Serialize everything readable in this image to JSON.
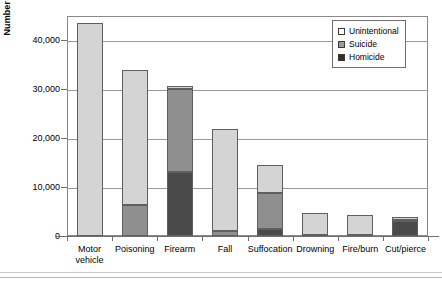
{
  "chart_data": {
    "type": "bar",
    "subtype": "stacked-bar",
    "title": "",
    "xlabel": "",
    "ylabel": "Number of Deaths",
    "ylim": [
      0,
      45000
    ],
    "yticks": [
      0,
      10000,
      20000,
      30000,
      40000
    ],
    "ytick_labels": [
      "0",
      "10,000",
      "20,000",
      "30,000",
      "40,000"
    ],
    "grid": true,
    "grid_axis": "y",
    "legend_position": "top-right",
    "categories": [
      "Motor\nvehicle",
      "Poisoning",
      "Firearm",
      "Fall",
      "Suffocation",
      "Drowning",
      "Fire/burn",
      "Cut/pierce"
    ],
    "series": [
      {
        "name": "Homicide",
        "color": "#4a4a4a",
        "values": [
          0,
          0,
          13000,
          0,
          1400,
          0,
          0,
          3000
        ]
      },
      {
        "name": "Suicide",
        "color": "#8f8f8f",
        "values": [
          0,
          6400,
          17000,
          1100,
          7300,
          300,
          200,
          200
        ]
      },
      {
        "name": "Unintentional",
        "color": "#d4d4d4",
        "values": [
          43600,
          27600,
          600,
          20800,
          5800,
          4500,
          4200,
          600
        ]
      }
    ],
    "totals": [
      43600,
      34000,
      30600,
      21900,
      14500,
      4800,
      4400,
      3800
    ]
  },
  "legend": {
    "items": [
      {
        "label": "Unintentional",
        "swatch": "legend-swatch-unintentional"
      },
      {
        "label": "Suicide",
        "swatch": "legend-swatch-suicide"
      },
      {
        "label": "Homicide",
        "swatch": "legend-swatch-homicide"
      }
    ]
  },
  "axes": {
    "y_title": "Number of Deaths"
  }
}
